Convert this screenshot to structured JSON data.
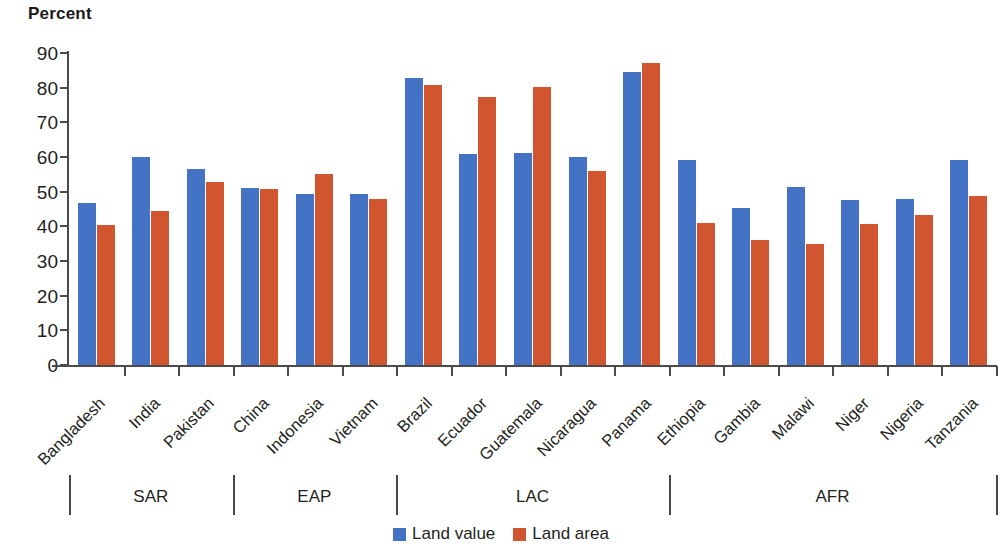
{
  "chart_data": {
    "type": "bar",
    "title": "",
    "ylabel": "Percent",
    "xlabel": "",
    "ylim": [
      0,
      90
    ],
    "ytick_step": 10,
    "yticks": [
      0,
      10,
      20,
      30,
      40,
      50,
      60,
      70,
      80,
      90
    ],
    "grid": false,
    "legend_position": "bottom-center",
    "categories": [
      "Bangladesh",
      "India",
      "Pakistan",
      "China",
      "Indonesia",
      "Vietnam",
      "Brazil",
      "Ecuador",
      "Guatemala",
      "Nicaragua",
      "Panama",
      "Ethiopia",
      "Gambia",
      "Malawi",
      "Niger",
      "Nigeria",
      "Tanzania"
    ],
    "series": [
      {
        "name": "Land value",
        "color": "#4472C4",
        "values": [
          46.6,
          60.0,
          56.5,
          51.0,
          49.3,
          49.2,
          82.8,
          60.8,
          61.2,
          59.9,
          84.4,
          59.1,
          45.4,
          51.3,
          47.7,
          47.9,
          59.2
        ]
      },
      {
        "name": "Land area",
        "color": "#D1552F",
        "values": [
          40.3,
          44.4,
          52.9,
          50.8,
          55.1,
          48.0,
          80.8,
          77.3,
          80.2,
          56.1,
          87.2,
          41.1,
          36.0,
          35.0,
          40.8,
          43.4,
          48.8
        ]
      }
    ],
    "groups": [
      {
        "label": "SAR",
        "categories": [
          "Bangladesh",
          "India",
          "Pakistan"
        ]
      },
      {
        "label": "EAP",
        "categories": [
          "China",
          "Indonesia",
          "Vietnam"
        ]
      },
      {
        "label": "LAC",
        "categories": [
          "Brazil",
          "Ecuador",
          "Guatemala",
          "Nicaragua",
          "Panama"
        ]
      },
      {
        "label": "AFR",
        "categories": [
          "Ethiopia",
          "Gambia",
          "Malawi",
          "Niger",
          "Nigeria",
          "Tanzania"
        ]
      }
    ]
  },
  "legend": {
    "items": [
      {
        "label": "Land value",
        "color": "#4472C4",
        "icon": "square-swatch-icon"
      },
      {
        "label": "Land area",
        "color": "#D1552F",
        "icon": "square-swatch-icon"
      }
    ]
  }
}
